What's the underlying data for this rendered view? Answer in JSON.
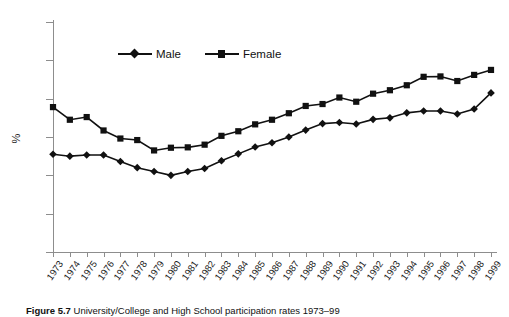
{
  "figure": {
    "caption_number": "Figure 5.7",
    "caption_text": "University/College and High School  participation rates  1973–99"
  },
  "axes": {
    "y_title": "%",
    "y_ticks": [
      0,
      10,
      20,
      30,
      40,
      50,
      60
    ],
    "y_min": 0,
    "y_max": 60
  },
  "legend": {
    "items": [
      {
        "label": "Male",
        "marker": "diamond",
        "color": "#111111"
      },
      {
        "label": "Female",
        "marker": "square",
        "color": "#111111"
      }
    ]
  },
  "chart_data": {
    "type": "line",
    "title": "",
    "xlabel": "",
    "ylabel": "%",
    "ylim": [
      0,
      60
    ],
    "grid": false,
    "legend_position": "top-center",
    "categories": [
      "1973",
      "1974",
      "1975",
      "1976",
      "1977",
      "1978",
      "1979",
      "1980",
      "1981",
      "1982",
      "1983",
      "1984",
      "1985",
      "1986",
      "1987",
      "1988",
      "1989",
      "1990",
      "1991",
      "1992",
      "1993",
      "1994",
      "1995",
      "1996",
      "1997",
      "1998",
      "1999"
    ],
    "series": [
      {
        "name": "Male",
        "marker": "diamond",
        "color": "#111111",
        "values": [
          25.5,
          25.0,
          25.3,
          25.3,
          23.6,
          22.0,
          21.0,
          20.0,
          21.0,
          21.8,
          23.8,
          25.6,
          27.4,
          28.5,
          30.0,
          31.8,
          33.5,
          33.8,
          33.4,
          34.6,
          35.0,
          36.3,
          36.8,
          36.8,
          36.0,
          37.3,
          41.5
        ]
      },
      {
        "name": "Female",
        "marker": "square",
        "color": "#111111",
        "values": [
          37.8,
          34.5,
          35.2,
          31.7,
          29.6,
          29.2,
          26.5,
          27.2,
          27.3,
          28.0,
          30.3,
          31.5,
          33.3,
          34.5,
          36.2,
          38.1,
          38.6,
          40.3,
          39.2,
          41.3,
          42.2,
          43.5,
          45.7,
          45.8,
          44.6,
          46.2,
          47.5
        ]
      }
    ]
  }
}
